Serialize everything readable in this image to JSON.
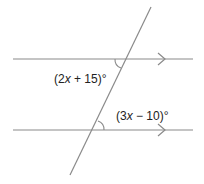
{
  "diagram": {
    "type": "parallel-lines-transversal",
    "line_color": "#8a8a8a",
    "angles": [
      {
        "id": "upper",
        "label_pre": "(2",
        "var": "x",
        "label_post": " + 15)°"
      },
      {
        "id": "lower",
        "label_pre": "(3",
        "var": "x",
        "label_post": " − 10)°"
      }
    ]
  }
}
